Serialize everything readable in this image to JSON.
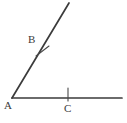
{
  "figure": {
    "kind": "geometry-angle-diagram",
    "width": 127,
    "height": 123,
    "background_color": "#ffffff",
    "stroke_color": "#3b3b3b",
    "label_color": "#3b3b3b",
    "stroke_width": 1.6,
    "tick_stroke_width": 1.1
  },
  "labels": {
    "vertex": "A",
    "ray_upper_point": "B",
    "ray_lower_point": "C"
  },
  "points": {
    "A": {
      "x": 12,
      "y": 98
    },
    "B_end": {
      "x": 69,
      "y": 3
    },
    "C_end": {
      "x": 122,
      "y": 98
    },
    "tick_on_AB": {
      "x": 42,
      "y": 51
    },
    "tick_on_AC": {
      "x": 68,
      "y": 98
    }
  },
  "segments": [
    {
      "name": "ray-AB",
      "x1": 12,
      "y1": 98,
      "x2": 69,
      "y2": 3
    },
    {
      "name": "ray-AC",
      "x1": 12,
      "y1": 98,
      "x2": 122,
      "y2": 98
    }
  ],
  "tick_marks": [
    {
      "name": "congruence-tick-AB",
      "x1": 36,
      "y1": 55,
      "x2": 48,
      "y2": 47
    },
    {
      "name": "congruence-tick-AC",
      "x1": 68,
      "y1": 89,
      "x2": 68,
      "y2": 101
    }
  ]
}
